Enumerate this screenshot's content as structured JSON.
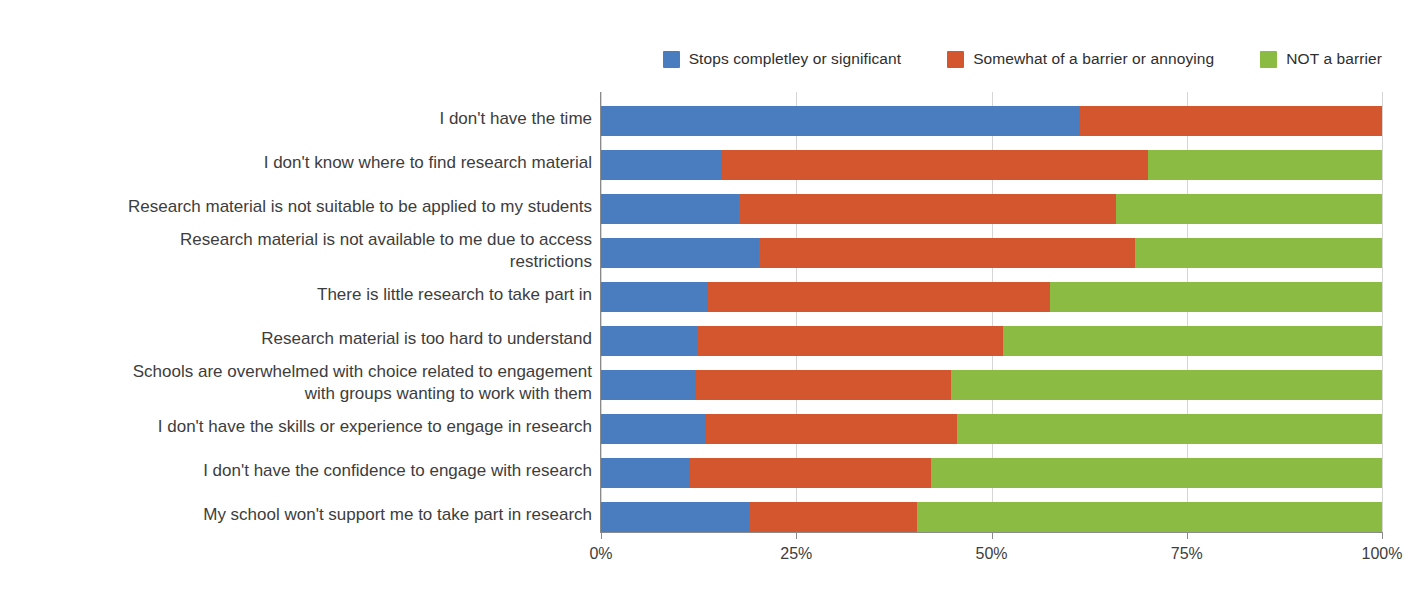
{
  "chart_data": {
    "type": "bar",
    "orientation": "horizontal",
    "stacked": true,
    "normalized_percent": true,
    "title": "",
    "xlabel": "",
    "ylabel": "",
    "xlim": [
      0,
      100
    ],
    "xticks": [
      0,
      25,
      50,
      75,
      100
    ],
    "xtick_labels": [
      "0%",
      "25%",
      "50%",
      "75%",
      "100%"
    ],
    "grid": true,
    "legend_position": "top-right",
    "categories": [
      "I don't have the time",
      "I don't know where to find research material",
      "Research material is not suitable to be applied to my students",
      "Research material is not available to me due to access restrictions",
      "There is little research to take part in",
      "Research material is too hard to understand",
      "Schools are overwhelmed with choice related to engagement with groups wanting to work with them",
      "I don't have the skills or experience to engage in research",
      "I don't have the confidence to engage with research",
      "My school won't support me to take part in research"
    ],
    "series": [
      {
        "name": "Stops completley or significant",
        "color": "#4a7dbf",
        "values": [
          61.3,
          15.5,
          17.7,
          20.2,
          13.7,
          12.3,
          12.2,
          13.5,
          11.4,
          19.1
        ]
      },
      {
        "name": "Somewhat of a barrier or annoying",
        "color": "#d4562f",
        "values": [
          38.7,
          54.5,
          48.2,
          48.2,
          43.8,
          39.2,
          32.6,
          32.1,
          30.8,
          21.3
        ]
      },
      {
        "name": "NOT a barrier",
        "color": "#8cbb43",
        "values": [
          0.0,
          30.0,
          34.1,
          31.6,
          42.5,
          48.5,
          55.2,
          54.4,
          57.8,
          59.6
        ]
      }
    ]
  },
  "legend": {
    "items": [
      {
        "label": "Stops completley or significant",
        "color": "#4a7dbf"
      },
      {
        "label": "Somewhat of a barrier or annoying",
        "color": "#d4562f"
      },
      {
        "label": "NOT a barrier",
        "color": "#8cbb43"
      }
    ]
  },
  "axis": {
    "x_tick_labels": [
      "0%",
      "25%",
      "50%",
      "75%",
      "100%"
    ]
  },
  "category_labels": [
    {
      "lines": [
        "I don't have the time"
      ]
    },
    {
      "lines": [
        "I don't know where to find research material"
      ]
    },
    {
      "lines": [
        "Research material is not suitable to be applied to my students"
      ]
    },
    {
      "lines": [
        "Research material is not available to me due to access",
        "restrictions"
      ]
    },
    {
      "lines": [
        "There is little research to take part in"
      ]
    },
    {
      "lines": [
        "Research material is too hard to understand"
      ]
    },
    {
      "lines": [
        "Schools are overwhelmed with choice related to engagement",
        "with groups wanting to work with them"
      ]
    },
    {
      "lines": [
        "I don't have the skills or experience to engage in research"
      ]
    },
    {
      "lines": [
        "I don't have the confidence to engage with research"
      ]
    },
    {
      "lines": [
        "My school won't support me to take part in research"
      ]
    }
  ]
}
